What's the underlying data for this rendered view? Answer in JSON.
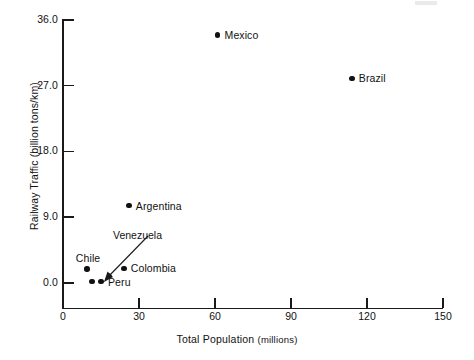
{
  "chart_data": {
    "type": "scatter",
    "title": "",
    "xlabel": "Total Population",
    "xlabel_unit": "(millions)",
    "ylabel": "Railway Traffic (billion tons/km)",
    "xlim": [
      0,
      150
    ],
    "ylim": [
      0.0,
      36.0
    ],
    "xticks": [
      0,
      30,
      60,
      90,
      120,
      150
    ],
    "xtick_labels": [
      "0",
      "30",
      "60",
      "90",
      "120",
      "150"
    ],
    "yticks": [
      0.0,
      9.0,
      18.0,
      27.0,
      36.0
    ],
    "ytick_labels": [
      "0.0",
      "9.0",
      "18.0",
      "27.0",
      "36.0"
    ],
    "grid": false,
    "legend": false,
    "points": [
      {
        "label": "Mexico",
        "x": 61.0,
        "y": 33.9,
        "label_pos": "right"
      },
      {
        "label": "Brazil",
        "x": 114.0,
        "y": 28.0,
        "label_pos": "right"
      },
      {
        "label": "Argentina",
        "x": 26.0,
        "y": 10.6,
        "label_pos": "right"
      },
      {
        "label": "Colombia",
        "x": 24.0,
        "y": 2.0,
        "label_pos": "right"
      },
      {
        "label": "Chile",
        "x": 9.5,
        "y": 1.9,
        "label_pos": "above"
      },
      {
        "label": "Venezuela",
        "x": 11.5,
        "y": 0.2,
        "label_pos": "callout"
      },
      {
        "label": "Peru",
        "x": 15.0,
        "y": 0.2,
        "label_pos": "right"
      }
    ],
    "annotations": [
      {
        "text": "Venezuela",
        "kind": "arrow-callout",
        "points_to": "Venezuela"
      }
    ]
  }
}
